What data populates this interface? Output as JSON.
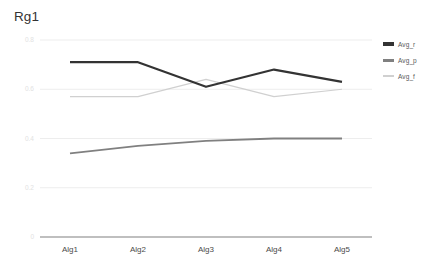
{
  "chart_data": {
    "type": "line",
    "title": "Rg1",
    "xlabel": "",
    "ylabel": "",
    "categories": [
      "Alg1",
      "Alg2",
      "Alg3",
      "Alg4",
      "Alg5"
    ],
    "series": [
      {
        "name": "Avg_r",
        "color": "#333333",
        "values": [
          0.71,
          0.71,
          0.61,
          0.68,
          0.63
        ]
      },
      {
        "name": "Avg_p",
        "color": "#808080",
        "values": [
          0.34,
          0.37,
          0.39,
          0.4,
          0.4
        ]
      },
      {
        "name": "Avg_f",
        "color": "#d0d0d0",
        "values": [
          0.57,
          0.57,
          0.64,
          0.57,
          0.6
        ]
      }
    ],
    "ylim": [
      0,
      0.8
    ],
    "y_ticks": [
      "0",
      "0.2",
      "0.4",
      "0.6",
      "0.8"
    ],
    "y_tick_values": [
      0,
      0.2,
      0.4,
      0.6,
      0.8
    ],
    "grid": true,
    "legend_position": "right",
    "gridline_color": "#ededed",
    "axis_color": "#808080"
  },
  "legend": {
    "entries": [
      {
        "label": "Avg_r"
      },
      {
        "label": "Avg_p"
      },
      {
        "label": "Avg_f"
      }
    ]
  }
}
